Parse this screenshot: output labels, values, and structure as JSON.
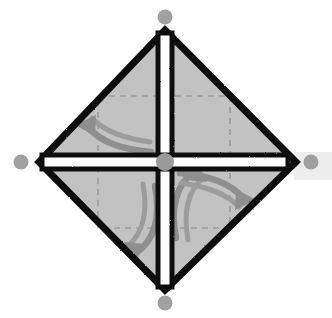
{
  "canvas": {
    "width": 332,
    "height": 318,
    "background_color": "#ffffff",
    "title": "Diamond transform handle diagram"
  },
  "colors": {
    "shape_fill": "#c2c2c2",
    "shape_fill_light": "#cccccc",
    "outline": "#111111",
    "cross_fill": "#ffffff",
    "arrow_gray": "#8f8f8f",
    "handle_gray": "#a0a0a0",
    "dashed_gray": "#8a8a8a",
    "faint_panel": "#ededed"
  },
  "shape": {
    "name": "diamond",
    "label": "rotated-square",
    "vertices": [
      {
        "name": "top",
        "x": 165,
        "y": 30
      },
      {
        "name": "right",
        "x": 296,
        "y": 162
      },
      {
        "name": "bottom",
        "x": 165,
        "y": 290
      },
      {
        "name": "left",
        "x": 39,
        "y": 162
      }
    ],
    "outline_width": 7,
    "fill": "#c2c2c2"
  },
  "cross": {
    "name": "center-cross",
    "center_x": 165,
    "center_y": 162,
    "arm_half_width": 7,
    "fill": "#ffffff",
    "stroke": "#111111",
    "stroke_width": 5
  },
  "dashed_rect": {
    "name": "selection-bounds",
    "x": 98,
    "y": 96,
    "width": 132,
    "height": 132,
    "stroke": "#8a8a8a",
    "dash": "6 5"
  },
  "faint_panel": {
    "name": "background-panel",
    "x": 294,
    "y": 152,
    "width": 38,
    "height": 28,
    "fill": "#ededed"
  },
  "handles": [
    {
      "name": "handle-top",
      "label": "Top handle",
      "x": 165,
      "y": 17,
      "r": 7.5,
      "color": "#a0a0a0"
    },
    {
      "name": "handle-right",
      "label": "Right handle",
      "x": 311,
      "y": 162,
      "r": 7.5,
      "color": "#a0a0a0"
    },
    {
      "name": "handle-bottom",
      "label": "Bottom handle",
      "x": 165,
      "y": 303,
      "r": 7.5,
      "color": "#a0a0a0"
    },
    {
      "name": "handle-left",
      "label": "Left handle",
      "x": 21,
      "y": 162,
      "r": 7.5,
      "color": "#a0a0a0"
    },
    {
      "name": "handle-center",
      "label": "Center handle",
      "x": 165,
      "y": 162,
      "r": 9.0,
      "color": "#9a9a9a"
    }
  ],
  "arrows": [
    {
      "name": "arrow-up",
      "label": "Rotate up",
      "quadrant": "top-right",
      "direction": "up",
      "color": "#8f8f8f",
      "body_path": "M 176 238 C 172 206 178 186 196 172",
      "head_points": "196 164 206 180 186 181"
    },
    {
      "name": "arrow-left",
      "label": "Rotate left",
      "quadrant": "top-left",
      "direction": "left",
      "color": "#8f8f8f",
      "body_path": "M 149 151 C 118 147 99 140 86 125",
      "head_points": "77 125 94 116 94 136"
    },
    {
      "name": "arrow-right",
      "label": "Rotate right",
      "quadrant": "bottom-right",
      "direction": "right",
      "color": "#8f8f8f",
      "body_path": "M 182 174 C 213 178 232 185 245 200",
      "head_points": "254 200 237 209 237 189"
    },
    {
      "name": "arrow-down",
      "label": "Rotate down",
      "quadrant": "bottom-left",
      "direction": "down",
      "color": "#8f8f8f",
      "body_path": "M 155 187 C 159 219 153 239 135 253",
      "head_points": "135 261 125 245 145 244"
    }
  ]
}
